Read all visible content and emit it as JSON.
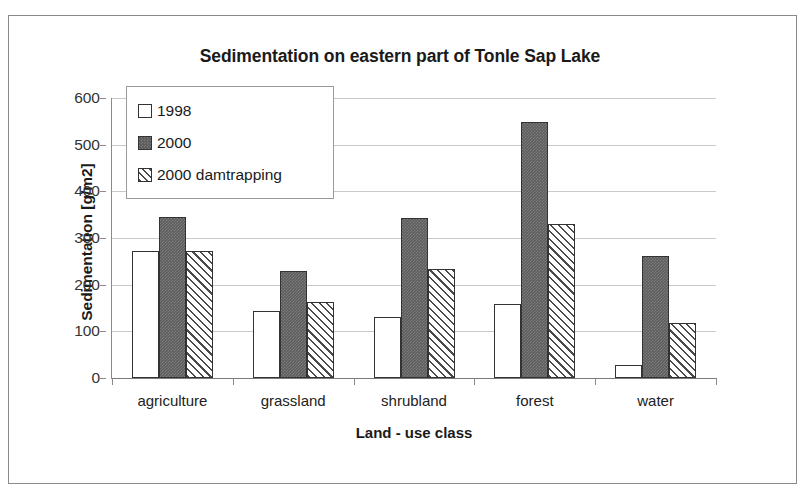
{
  "chart_data": {
    "type": "bar",
    "title": "Sedimentation on eastern part of Tonle Sap Lake",
    "xlabel": "Land - use class",
    "ylabel": "Sedimentation [g/m2]",
    "categories": [
      "agriculture",
      "grassland",
      "shrubland",
      "forest",
      "water"
    ],
    "series": [
      {
        "name": "1998",
        "values": [
          273,
          143,
          130,
          158,
          28
        ]
      },
      {
        "name": "2000",
        "values": [
          345,
          229,
          342,
          549,
          262
        ]
      },
      {
        "name": "2000 damtrapping",
        "values": [
          273,
          163,
          233,
          331,
          117
        ]
      }
    ],
    "ylim": [
      0,
      600
    ],
    "ytick_labels": [
      "600",
      "500",
      "400",
      "300",
      "200",
      "100",
      "0"
    ],
    "ytick_values": [
      600,
      500,
      400,
      300,
      200,
      100,
      0
    ],
    "grid": true,
    "legend_position": "top-left",
    "colors": {
      "series_1998": "#ffffff",
      "series_2000": "#5e5e5e",
      "series_2000_damtrapping": "#4a4a4a",
      "bar_outline": "#333333",
      "gridline": "#c9c9c9",
      "axis": "#8a8a8a",
      "text": "#1a1a1a",
      "background": "#ffffff"
    }
  }
}
